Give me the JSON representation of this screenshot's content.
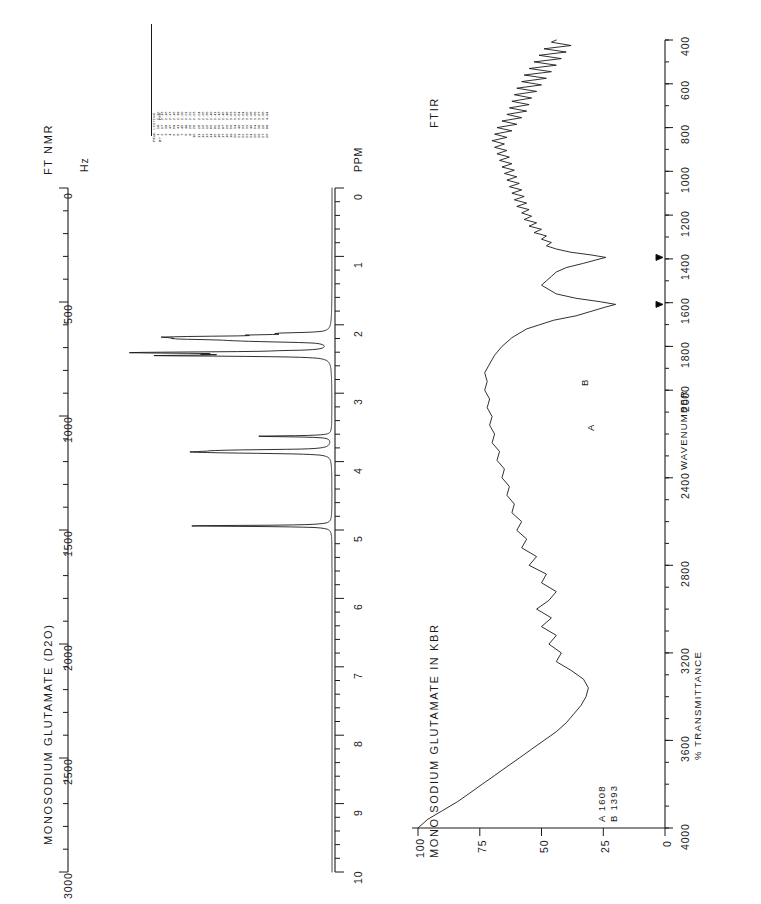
{
  "page": {
    "orientation": "rotated-90-ccw",
    "background": "#ffffff",
    "ink": "#1a1a1a"
  },
  "nmr": {
    "technique_label": "FT NMR",
    "sample_title": "MONOSODIUM GLUTAMATE (D2O)",
    "hz_axis_label": "Hz",
    "ppm_axis_label": "PPM",
    "hz_ticks": [
      "0",
      "500",
      "1000",
      "1500",
      "2000",
      "2500",
      "3000"
    ],
    "ppm_ticks": [
      "0",
      "1",
      "2",
      "3",
      "4",
      "5",
      "6",
      "7",
      "8",
      "9",
      "10"
    ]
  },
  "peak_listing": {
    "title": "PEAK LISTING",
    "col_ht": "HT",
    "col_ppm": "PPM",
    "rows": [
      {
        "n": "1",
        "ht": "19",
        "ppm": "2.12"
      },
      {
        "n": "2",
        "ht": "17",
        "ppm": "2.13"
      },
      {
        "n": "3",
        "ht": "36",
        "ppm": "2.15"
      },
      {
        "n": "4",
        "ht": "47",
        "ppm": "2.17"
      },
      {
        "n": "5",
        "ht": "59",
        "ppm": "2.18"
      },
      {
        "n": "6",
        "ht": "41",
        "ppm": "2.19"
      },
      {
        "n": "7",
        "ht": "45",
        "ppm": "2.20"
      },
      {
        "n": "8",
        "ht": "49",
        "ppm": "2.21"
      },
      {
        "n": "9",
        "ht": "26",
        "ppm": "2.22"
      },
      {
        "n": "10",
        "ht": "26",
        "ppm": "2.23"
      },
      {
        "n": "11",
        "ht": "26",
        "ppm": "2.24"
      },
      {
        "n": "12",
        "ht": "15",
        "ppm": "2.25"
      },
      {
        "n": "13",
        "ht": "15",
        "ppm": "2.38"
      },
      {
        "n": "14",
        "ht": "65",
        "ppm": "2.40"
      },
      {
        "n": "15",
        "ht": "92",
        "ppm": "2.41"
      },
      {
        "n": "16",
        "ht": "50",
        "ppm": "2.43"
      },
      {
        "n": "17",
        "ht": "97",
        "ppm": "2.45"
      },
      {
        "n": "18",
        "ht": "20",
        "ppm": "2.46"
      },
      {
        "n": "19",
        "ht": "50",
        "ppm": "3.63"
      },
      {
        "n": "20",
        "ht": "34",
        "ppm": "3.83"
      },
      {
        "n": "21",
        "ht": "40",
        "ppm": "3.84"
      },
      {
        "n": "22",
        "ht": "33",
        "ppm": "3.84"
      },
      {
        "n": "23",
        "ht": "33",
        "ppm": "3.85"
      },
      {
        "n": "24",
        "ht": "40",
        "ppm": "3.86"
      },
      {
        "n": "25",
        "ht": "54",
        "ppm": "3.86"
      },
      {
        "n": "26",
        "ht": "36",
        "ppm": "3.87"
      },
      {
        "n": "27",
        "ht": "18",
        "ppm": "3.88"
      },
      {
        "n": "28",
        "ht": "99",
        "ppm": "4.94"
      }
    ]
  },
  "ftir": {
    "technique_label": "FTIR",
    "sample_title": "MONO SODIUM GLUTAMATE IN KBR",
    "x_axis_label": "WAVENUMBER",
    "y_axis_label": "% TRANSMITTANCE",
    "x_ticks": [
      "400",
      "600",
      "800",
      "1000",
      "1200",
      "1400",
      "1600",
      "1800",
      "2000",
      "2400",
      "2800",
      "3200",
      "3600",
      "4000"
    ],
    "y_ticks": [
      "0",
      "25",
      "50",
      "75",
      "100"
    ],
    "markers": [
      {
        "id": "A",
        "wavenumber": "1608",
        "legend": "A 1608"
      },
      {
        "id": "B",
        "wavenumber": "1393",
        "legend": "B 1393"
      }
    ]
  },
  "chart_data": [
    {
      "type": "line",
      "title": "FT NMR — MONOSODIUM GLUTAMATE (D2O)",
      "xlabel": "PPM",
      "ylabel": "Intensity",
      "xlim": [
        0,
        10
      ],
      "x2label": "Hz",
      "x2lim": [
        0,
        3000
      ],
      "grid": false,
      "legend": "none",
      "peaks": [
        {
          "ppm": 2.12,
          "height": 19
        },
        {
          "ppm": 2.13,
          "height": 17
        },
        {
          "ppm": 2.15,
          "height": 36
        },
        {
          "ppm": 2.17,
          "height": 47
        },
        {
          "ppm": 2.18,
          "height": 59
        },
        {
          "ppm": 2.19,
          "height": 41
        },
        {
          "ppm": 2.2,
          "height": 45
        },
        {
          "ppm": 2.21,
          "height": 49
        },
        {
          "ppm": 2.22,
          "height": 26
        },
        {
          "ppm": 2.23,
          "height": 26
        },
        {
          "ppm": 2.24,
          "height": 26
        },
        {
          "ppm": 2.25,
          "height": 15
        },
        {
          "ppm": 2.38,
          "height": 15
        },
        {
          "ppm": 2.4,
          "height": 65
        },
        {
          "ppm": 2.41,
          "height": 92
        },
        {
          "ppm": 2.43,
          "height": 50
        },
        {
          "ppm": 2.45,
          "height": 97
        },
        {
          "ppm": 2.46,
          "height": 20
        },
        {
          "ppm": 3.63,
          "height": 50
        },
        {
          "ppm": 3.83,
          "height": 34
        },
        {
          "ppm": 3.84,
          "height": 40
        },
        {
          "ppm": 3.85,
          "height": 33
        },
        {
          "ppm": 3.86,
          "height": 54
        },
        {
          "ppm": 3.87,
          "height": 36
        },
        {
          "ppm": 3.88,
          "height": 18
        },
        {
          "ppm": 4.94,
          "height": 99
        }
      ]
    },
    {
      "type": "line",
      "title": "FTIR — MONO SODIUM GLUTAMATE IN KBR",
      "xlabel": "WAVENUMBER",
      "ylabel": "% TRANSMITTANCE",
      "xlim": [
        4000,
        400
      ],
      "ylim": [
        0,
        100
      ],
      "grid": false,
      "legend": "none",
      "annotations": [
        "A 1608",
        "B 1393"
      ],
      "points": [
        [
          4000,
          100
        ],
        [
          3960,
          96
        ],
        [
          3920,
          90
        ],
        [
          3880,
          84
        ],
        [
          3840,
          79
        ],
        [
          3800,
          74
        ],
        [
          3760,
          69
        ],
        [
          3720,
          64
        ],
        [
          3680,
          59
        ],
        [
          3640,
          54
        ],
        [
          3600,
          49
        ],
        [
          3560,
          44
        ],
        [
          3520,
          40
        ],
        [
          3480,
          37
        ],
        [
          3440,
          34
        ],
        [
          3400,
          32
        ],
        [
          3360,
          31
        ],
        [
          3320,
          33
        ],
        [
          3280,
          38
        ],
        [
          3240,
          44
        ],
        [
          3200,
          42
        ],
        [
          3160,
          47
        ],
        [
          3120,
          44
        ],
        [
          3080,
          50
        ],
        [
          3040,
          46
        ],
        [
          3000,
          52
        ],
        [
          2960,
          47
        ],
        [
          2920,
          44
        ],
        [
          2880,
          50
        ],
        [
          2840,
          48
        ],
        [
          2800,
          55
        ],
        [
          2760,
          52
        ],
        [
          2720,
          58
        ],
        [
          2680,
          56
        ],
        [
          2640,
          60
        ],
        [
          2600,
          58
        ],
        [
          2560,
          62
        ],
        [
          2520,
          61
        ],
        [
          2480,
          64
        ],
        [
          2440,
          63
        ],
        [
          2400,
          66
        ],
        [
          2360,
          65
        ],
        [
          2320,
          68
        ],
        [
          2280,
          67
        ],
        [
          2240,
          70
        ],
        [
          2200,
          69
        ],
        [
          2160,
          71
        ],
        [
          2120,
          70
        ],
        [
          2080,
          72
        ],
        [
          2040,
          71
        ],
        [
          2000,
          73
        ],
        [
          1960,
          72
        ],
        [
          1920,
          73
        ],
        [
          1880,
          71
        ],
        [
          1840,
          69
        ],
        [
          1800,
          66
        ],
        [
          1760,
          62
        ],
        [
          1720,
          56
        ],
        [
          1680,
          45
        ],
        [
          1660,
          36
        ],
        [
          1640,
          30
        ],
        [
          1620,
          24
        ],
        [
          1608,
          20
        ],
        [
          1596,
          26
        ],
        [
          1580,
          36
        ],
        [
          1560,
          44
        ],
        [
          1540,
          47
        ],
        [
          1520,
          50
        ],
        [
          1500,
          48
        ],
        [
          1480,
          46
        ],
        [
          1460,
          44
        ],
        [
          1440,
          40
        ],
        [
          1420,
          33
        ],
        [
          1405,
          28
        ],
        [
          1393,
          24
        ],
        [
          1382,
          30
        ],
        [
          1370,
          38
        ],
        [
          1355,
          44
        ],
        [
          1340,
          48
        ],
        [
          1325,
          46
        ],
        [
          1310,
          50
        ],
        [
          1295,
          48
        ],
        [
          1280,
          53
        ],
        [
          1265,
          50
        ],
        [
          1250,
          55
        ],
        [
          1235,
          52
        ],
        [
          1220,
          57
        ],
        [
          1205,
          54
        ],
        [
          1190,
          58
        ],
        [
          1175,
          55
        ],
        [
          1160,
          60
        ],
        [
          1145,
          56
        ],
        [
          1130,
          61
        ],
        [
          1115,
          57
        ],
        [
          1100,
          62
        ],
        [
          1085,
          58
        ],
        [
          1070,
          63
        ],
        [
          1055,
          59
        ],
        [
          1040,
          64
        ],
        [
          1025,
          60
        ],
        [
          1010,
          65
        ],
        [
          995,
          61
        ],
        [
          980,
          66
        ],
        [
          965,
          62
        ],
        [
          950,
          67
        ],
        [
          935,
          63
        ],
        [
          920,
          68
        ],
        [
          905,
          64
        ],
        [
          890,
          69
        ],
        [
          875,
          65
        ],
        [
          860,
          70
        ],
        [
          845,
          64
        ],
        [
          830,
          69
        ],
        [
          815,
          62
        ],
        [
          800,
          68
        ],
        [
          785,
          60
        ],
        [
          770,
          66
        ],
        [
          755,
          58
        ],
        [
          740,
          64
        ],
        [
          725,
          56
        ],
        [
          710,
          63
        ],
        [
          695,
          55
        ],
        [
          680,
          62
        ],
        [
          665,
          54
        ],
        [
          650,
          61
        ],
        [
          635,
          52
        ],
        [
          620,
          60
        ],
        [
          605,
          50
        ],
        [
          590,
          58
        ],
        [
          575,
          48
        ],
        [
          560,
          57
        ],
        [
          545,
          46
        ],
        [
          530,
          55
        ],
        [
          515,
          44
        ],
        [
          500,
          53
        ],
        [
          485,
          42
        ],
        [
          470,
          51
        ],
        [
          455,
          40
        ],
        [
          440,
          49
        ],
        [
          425,
          38
        ],
        [
          410,
          46
        ],
        [
          400,
          44
        ]
      ]
    }
  ]
}
